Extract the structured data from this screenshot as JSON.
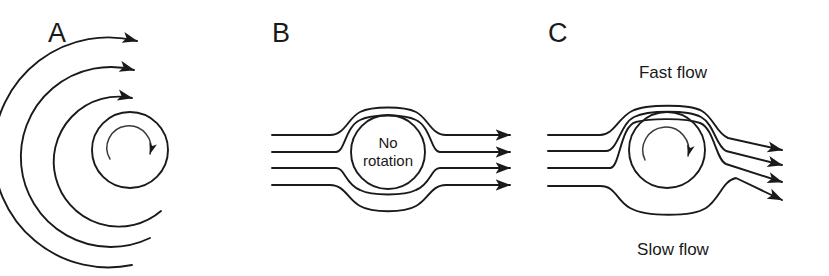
{
  "figure": {
    "background": "#ffffff",
    "ink": "#1a1a1a",
    "width": 829,
    "height": 276,
    "caption_panels": 3
  },
  "panels": {
    "a": {
      "label": "A",
      "description": "rotating cylinder with concentric circulation streamlines",
      "center": {
        "x": 130,
        "y": 150
      },
      "arc_radii": [
        115,
        90,
        65,
        38
      ],
      "inner_rotation_radius": 22,
      "rotation_direction": "clockwise",
      "arrow_count": 3
    },
    "b": {
      "label": "B",
      "circle_text_line1": "No",
      "circle_text_line2": "rotation",
      "center": {
        "x": 388,
        "y": 152
      },
      "radius": 37,
      "streamline_count": 4,
      "inlet_y": [
        135,
        152,
        168,
        185
      ],
      "outlet_y": [
        137,
        152,
        168,
        185
      ],
      "inlet_x": 272,
      "outlet_x": 518,
      "deflection": "none"
    },
    "c": {
      "label": "C",
      "top_label": "Fast flow",
      "bottom_label": "Slow flow",
      "center": {
        "x": 667,
        "y": 150
      },
      "radius": 38,
      "rotation_direction": "clockwise",
      "streamline_count": 4,
      "inlet_y": [
        135,
        151,
        168,
        186
      ],
      "outlet_y": [
        150,
        165,
        182,
        200
      ],
      "inlet_x": 548,
      "outlet_x": 790,
      "deflection": "downward"
    }
  }
}
